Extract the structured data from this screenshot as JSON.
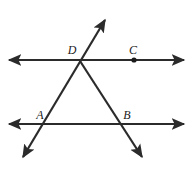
{
  "figure": {
    "background_color": "#ffffff",
    "stroke_color": "#2b2b2b",
    "label_color": "#1b1b1b",
    "stroke_width": 2.2
  },
  "labels": {
    "point_d": "D",
    "point_c": "C",
    "point_a": "A",
    "point_b": "B"
  },
  "points": {
    "D": {
      "x": 82,
      "y": 60,
      "label_x": 72,
      "label_y": 54,
      "marked_dot": false
    },
    "C": {
      "x": 134,
      "y": 60,
      "label_x": 129,
      "label_y": 54,
      "marked_dot": true
    },
    "A": {
      "x": 45,
      "y": 124,
      "label_x": 35,
      "label_y": 119,
      "marked_dot": false
    },
    "B": {
      "x": 119,
      "y": 124,
      "label_x": 122,
      "label_y": 119,
      "marked_dot": false
    }
  },
  "lines": {
    "top_parallel": {
      "name": "top horizontal line",
      "x1": 9,
      "y1": 60,
      "x2": 184,
      "y2": 60,
      "arrow_start": true,
      "arrow_end": true
    },
    "bottom_parallel": {
      "name": "bottom horizontal line",
      "x1": 9,
      "y1": 124,
      "x2": 184,
      "y2": 124,
      "arrow_start": true,
      "arrow_end": true
    },
    "transversal_left": {
      "name": "transversal through A and D",
      "x1": 23,
      "y1": 157,
      "x2": 105,
      "y2": 20,
      "arrow_start": true,
      "arrow_end": true
    },
    "transversal_right": {
      "name": "transversal through D and B",
      "x1": 80,
      "y1": 61,
      "x2": 142,
      "y2": 157,
      "arrow_start": false,
      "arrow_end": true
    }
  }
}
